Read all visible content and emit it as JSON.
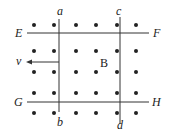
{
  "diagram": {
    "labels": {
      "a": "a",
      "b": "b",
      "c": "c",
      "d": "d",
      "E": "E",
      "F": "F",
      "G": "G",
      "H": "H",
      "v": "v",
      "B": "B"
    },
    "field": {
      "direction": "out-of-page",
      "symbol": "dot"
    },
    "colors": {
      "ink": "#222222",
      "background": "#ffffff"
    }
  }
}
